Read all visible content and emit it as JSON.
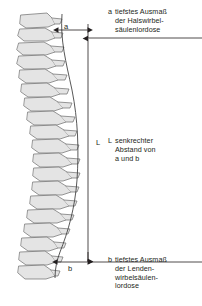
{
  "figure": {
    "background_color": "#ffffff",
    "ink_color": "#231f20",
    "bone_fill": "#e4e4e4",
    "bone_stroke": "#6b6b6b",
    "dim_line_color": "#231f20"
  },
  "dimensions": {
    "a": {
      "letter": "a",
      "orientation": "horizontal",
      "y": 30,
      "x_start": 58,
      "x_end": 88
    },
    "b": {
      "letter": "b",
      "orientation": "horizontal",
      "y": 262,
      "x_start": 57,
      "x_end": 88
    },
    "L": {
      "letter": "L",
      "orientation": "vertical",
      "x": 88,
      "y_start": 38,
      "y_end": 262
    }
  },
  "legend": {
    "a": {
      "key": "a",
      "lines": [
        "tiefstes Ausmaß",
        "der Halswirbel-",
        "säulenlordose"
      ]
    },
    "L": {
      "key": "L",
      "lines": [
        "senkrechter",
        "Abstand von",
        "a und b"
      ]
    },
    "b": {
      "key": "b",
      "lines": [
        "tiefstes Ausmaß",
        "der Lenden-",
        "wirbelsäulen-",
        "lordose"
      ]
    }
  },
  "anatomy": {
    "label": "lateral view of vertebral column",
    "vertebra_count": 18,
    "regions": [
      "Halswirbelsäule",
      "Brustwirbelsäule",
      "Lendenwirbelsäule"
    ]
  }
}
